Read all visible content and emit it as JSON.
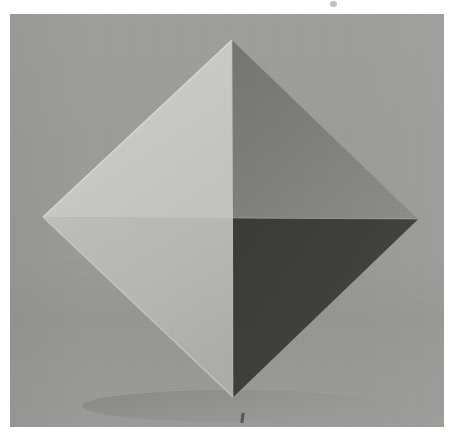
{
  "figure": {
    "title": "Octahedron shading study",
    "caption": "",
    "media_type": "photograph",
    "canvas": {
      "width": 456,
      "height": 444
    }
  },
  "page": {
    "background_color": "#ffffff",
    "margin_left": 10,
    "margin_top": 14,
    "margin_right": 12,
    "margin_bottom": 17
  },
  "photo": {
    "x": 10,
    "y": 14,
    "width": 434,
    "height": 413,
    "background_color": "#9a9a98",
    "background_label": "gray studio backdrop"
  },
  "solid": {
    "name": "octahedron",
    "label": "octahedron seen corner-on, four faces visible",
    "vertices": {
      "top": {
        "x": 232,
        "y": 40,
        "label": "top vertex"
      },
      "left": {
        "x": 43,
        "y": 217,
        "label": "left vertex"
      },
      "right": {
        "x": 418,
        "y": 219,
        "label": "right vertex"
      },
      "bottom": {
        "x": 233,
        "y": 397,
        "label": "bottom vertex"
      },
      "center": {
        "x": 233,
        "y": 218,
        "label": "center vertex (nearest)"
      }
    },
    "faces": [
      {
        "id": "face-top-left",
        "label": "upper left face",
        "tone": "light",
        "color": "#c9c9c6",
        "color_edge": "#d3d3d0",
        "value_step": 1
      },
      {
        "id": "face-top-right",
        "label": "upper right face",
        "tone": "mid",
        "color": "#7d7d7c",
        "color_edge": "#888886",
        "value_step": 3
      },
      {
        "id": "face-bottom-left",
        "label": "lower left face",
        "tone": "light-mid",
        "color": "#b5b5b2",
        "color_edge": "#bfbfbc",
        "value_step": 2
      },
      {
        "id": "face-bottom-right",
        "label": "lower right face",
        "tone": "dark",
        "color": "#3d3d3b",
        "color_edge": "#474745",
        "value_step": 4
      }
    ],
    "edges": {
      "highlight_color": "#e3e3e0",
      "shadow_color": "#6f6f6d"
    }
  },
  "artifacts": {
    "dust_speck": {
      "label": "dust speck",
      "x": 330,
      "y": 1
    },
    "scratch_mark": {
      "label": "scratch mark",
      "x": 231,
      "y": 399
    }
  }
}
